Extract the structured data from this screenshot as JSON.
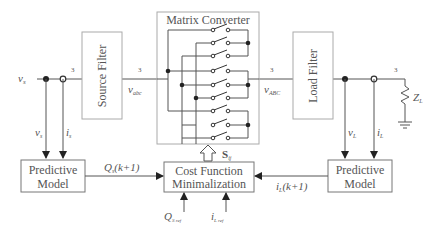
{
  "blocks": {
    "source_filter": "Source Filter",
    "matrix_converter": "Matrix Converter",
    "load_filter": "Load Filter",
    "predictive_model_left": [
      "Predictive",
      "Model"
    ],
    "predictive_model_right": [
      "Predictive",
      "Model"
    ],
    "cost_function": [
      "Cost Function",
      "Minimalization"
    ]
  },
  "signals": {
    "vs_in": "v",
    "vs_in_sub": "s",
    "phase_count_1": "3",
    "phase_count_2": "3",
    "phase_count_3": "3",
    "phase_count_4": "3",
    "v_abc": "v",
    "v_abc_sub": "abc",
    "v_ABC": "v",
    "v_ABC_sub": "ABC",
    "vs_meas": "v",
    "vs_meas_sub": "s",
    "is_meas": "i",
    "is_meas_sub": "s",
    "vL_meas": "v",
    "vL_meas_sub": "L",
    "iL_meas": "i",
    "iL_meas_sub": "L",
    "load": "Z",
    "load_sub": "L",
    "Qs_pred": "Q",
    "Qs_pred_sub": "s",
    "Qs_pred_arg": "(k+1)",
    "iL_pred": "i",
    "iL_pred_sub": "L",
    "iL_pred_arg": "(k+1)",
    "switch_signal": "S",
    "switch_signal_sub": "ij",
    "Q_ref": "Q",
    "Q_ref_sub": "S ref",
    "i_ref": "i",
    "i_ref_sub": "L ref"
  }
}
